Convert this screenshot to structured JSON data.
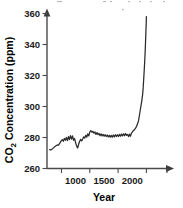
{
  "chart_data": {
    "type": "line",
    "title": "",
    "xlabel": "Year",
    "ylabel": "CO2 Concentration (ppm)",
    "ylabel_parts": {
      "prefix": "CO",
      "subscript": "2",
      "suffix": " Concentration (ppm)"
    },
    "xlim": [
      850,
      2120
    ],
    "ylim": [
      260,
      362
    ],
    "xticks": [
      1000,
      1500,
      2000
    ],
    "xtick_labels": [
      "1000",
      "1500",
      "2000"
    ],
    "yticks": [
      260,
      280,
      300,
      320,
      340,
      360
    ],
    "ytick_labels": [
      "260",
      "280",
      "300",
      "320",
      "340",
      "360"
    ],
    "grid": false,
    "legend": null,
    "axes_style": "arrow-terminated-open",
    "line_color": "#2b2b2b",
    "series": [
      {
        "name": "Atmospheric CO2 concentration",
        "x": [
          860,
          875,
          890,
          905,
          920,
          935,
          950,
          965,
          980,
          995,
          1010,
          1022,
          1034,
          1046,
          1058,
          1070,
          1082,
          1094,
          1106,
          1118,
          1130,
          1142,
          1154,
          1166,
          1178,
          1190,
          1202,
          1214,
          1226,
          1238,
          1250,
          1262,
          1274,
          1286,
          1298,
          1310,
          1322,
          1334,
          1346,
          1358,
          1370,
          1382,
          1394,
          1406,
          1418,
          1430,
          1442,
          1454,
          1466,
          1478,
          1490,
          1502,
          1514,
          1526,
          1538,
          1550,
          1562,
          1574,
          1586,
          1598,
          1610,
          1622,
          1634,
          1646,
          1658,
          1670,
          1682,
          1694,
          1706,
          1718,
          1730,
          1742,
          1754,
          1766,
          1778,
          1790,
          1800,
          1812,
          1824,
          1836,
          1848,
          1860,
          1872,
          1884,
          1896,
          1908,
          1920,
          1932,
          1944,
          1956,
          1962,
          1968,
          1974,
          1980,
          1986,
          1990,
          1994,
          1998,
          2000
        ],
        "y": [
          272.2,
          272.0,
          272.6,
          273.3,
          274.0,
          274.6,
          275.2,
          275.0,
          276.4,
          277.6,
          278.6,
          277.6,
          279.4,
          278.2,
          280.0,
          278.0,
          280.6,
          278.6,
          281.2,
          279.0,
          281.0,
          278.2,
          279.4,
          276.6,
          274.6,
          273.2,
          275.6,
          277.6,
          278.8,
          277.8,
          279.0,
          280.4,
          279.6,
          281.4,
          280.2,
          282.4,
          281.0,
          283.6,
          284.4,
          283.4,
          284.0,
          282.8,
          283.6,
          282.0,
          283.2,
          281.8,
          282.6,
          281.2,
          282.4,
          281.0,
          282.0,
          280.8,
          281.8,
          280.6,
          281.6,
          280.4,
          281.4,
          280.2,
          281.4,
          280.2,
          281.6,
          280.4,
          281.8,
          280.6,
          281.8,
          280.6,
          282.0,
          280.8,
          282.2,
          281.0,
          282.4,
          281.2,
          282.6,
          281.4,
          282.0,
          280.6,
          282.2,
          280.8,
          282.8,
          283.6,
          284.6,
          285.0,
          286.0,
          287.2,
          288.8,
          291.0,
          295.0,
          299.2,
          303.0,
          308.0,
          312.0,
          317.5,
          323.0,
          329.0,
          336.0,
          342.0,
          348.0,
          354.0,
          358.0
        ]
      }
    ]
  }
}
